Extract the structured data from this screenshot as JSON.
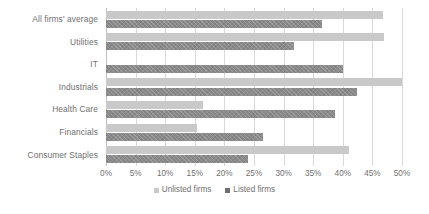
{
  "chart_data": {
    "type": "bar",
    "orientation": "horizontal",
    "title": "",
    "subtitle": "",
    "xlabel": "",
    "ylabel": "",
    "xlim": [
      0,
      50
    ],
    "xtick_step": 5,
    "xtick_labels": [
      "0%",
      "5%",
      "10%",
      "15%",
      "20%",
      "25%",
      "30%",
      "35%",
      "40%",
      "45%",
      "50%"
    ],
    "xtick_values": [
      0,
      5,
      10,
      15,
      20,
      25,
      30,
      35,
      40,
      45,
      50
    ],
    "grid": true,
    "grid_axis": "x",
    "legend_position": "bottom",
    "categories": [
      "All firms' average",
      "Utilities",
      "IT",
      "Industrials",
      "Health Care",
      "Financials",
      "Consumer Staples"
    ],
    "series": [
      {
        "name": "Unlisted firms",
        "color": "#c9c9c9",
        "values": [
          46.8,
          47.0,
          0,
          50.0,
          16.4,
          15.3,
          41.0
        ]
      },
      {
        "name": "Listed firms",
        "color": "#8a8a8a",
        "values": [
          36.5,
          31.8,
          40.0,
          42.4,
          38.7,
          26.5,
          24.0
        ]
      }
    ]
  },
  "legend": {
    "items": [
      {
        "label": "Unlisted firms",
        "swatch": "unlisted"
      },
      {
        "label": "Listed firms",
        "swatch": "listed"
      }
    ]
  },
  "colors": {
    "unlisted": "#c9c9c9",
    "listed": "#8a8a8a",
    "gridline": "#d9d9d9",
    "axis": "#bfbfbf",
    "text": "#6f6f6f",
    "background": "#ffffff"
  }
}
